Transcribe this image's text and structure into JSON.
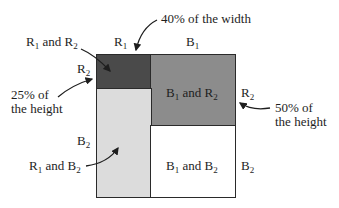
{
  "diagram": {
    "type": "probability-area-diagram",
    "colors": {
      "r1_and_r2": "#4a4a4a",
      "b1_and_r2": "#8c8c8c",
      "r1_and_b2": "#dcdcdc",
      "b1_and_b2": "#ffffff",
      "border": "#2a2a2a"
    },
    "column_headers": {
      "left": {
        "letter": "R",
        "sub": "1"
      },
      "right": {
        "letter": "B",
        "sub": "1"
      }
    },
    "row_labels": {
      "left_top": {
        "letter": "R",
        "sub": "2"
      },
      "left_bottom": {
        "letter": "B",
        "sub": "2"
      },
      "right_top": {
        "letter": "R",
        "sub": "2"
      },
      "right_bottom": {
        "letter": "B",
        "sub": "2"
      }
    },
    "cells": {
      "r1_and_r2": {
        "a": "R",
        "a_sub": "1",
        "mid": " and ",
        "b": "R",
        "b_sub": "2"
      },
      "b1_and_r2": {
        "a": "B",
        "a_sub": "1",
        "mid": " and ",
        "b": "R",
        "b_sub": "2"
      },
      "r1_and_b2": {
        "a": "R",
        "a_sub": "1",
        "mid": " and ",
        "b": "B",
        "b_sub": "2"
      },
      "b1_and_b2": {
        "a": "B",
        "a_sub": "1",
        "mid": " and ",
        "b": "B",
        "b_sub": "2"
      }
    },
    "annotations": {
      "width": "40% of the width",
      "left_height_line1": "25% of",
      "left_height_line2": "the height",
      "right_height_line1": "50% of",
      "right_height_line2": "the height"
    },
    "proportions": {
      "r1_width": "40%",
      "r2_given_r1_height": "25%",
      "r2_given_b1_height": "50%"
    }
  }
}
